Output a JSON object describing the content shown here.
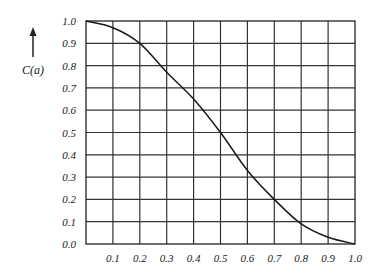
{
  "chart_data": {
    "type": "line",
    "title": "",
    "xlabel": "",
    "ylabel": "C(a)",
    "xlim": [
      0.0,
      1.0
    ],
    "ylim": [
      0.0,
      1.0
    ],
    "grid": true,
    "x_ticks": [
      "0.1",
      "0.2",
      "0.3",
      "0.4",
      "0.5",
      "0.6",
      "0.7",
      "0.8",
      "0.9",
      "1.0"
    ],
    "y_ticks": [
      "1.0",
      "0.9",
      "0.8",
      "0.7",
      "0.6",
      "0.5",
      "0.4",
      "0.3",
      "0.2",
      "0.1",
      "0.0"
    ],
    "series": [
      {
        "name": "C(a)",
        "x": [
          0.0,
          0.1,
          0.2,
          0.3,
          0.4,
          0.5,
          0.6,
          0.7,
          0.8,
          0.9,
          1.0
        ],
        "y": [
          1.0,
          0.97,
          0.9,
          0.77,
          0.65,
          0.5,
          0.33,
          0.2,
          0.09,
          0.03,
          0.0
        ]
      }
    ]
  }
}
